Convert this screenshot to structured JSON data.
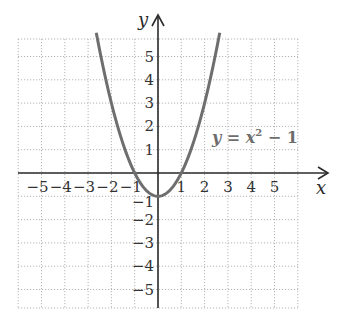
{
  "chart_data": {
    "type": "line",
    "title": "",
    "xlabel": "x",
    "ylabel": "y",
    "xlim": [
      -6,
      6
    ],
    "ylim": [
      -6,
      6.3
    ],
    "grid": true,
    "x_ticks": [
      -5,
      -4,
      -3,
      -2,
      -1,
      1,
      2,
      3,
      4,
      5
    ],
    "y_ticks": [
      -5,
      -4,
      -3,
      -2,
      -1,
      1,
      2,
      3,
      4,
      5
    ],
    "x_tick_labels": [
      "−5",
      "−4",
      "−3",
      "−2",
      "−1",
      "1",
      "2",
      "3",
      "4",
      "5"
    ],
    "y_tick_labels": [
      "−5",
      "−4",
      "−3",
      "−2",
      "−1",
      "1",
      "2",
      "3",
      "4",
      "5"
    ],
    "series": [
      {
        "name": "y = x² − 1",
        "function": "x^2 - 1",
        "x": [
          -2.65,
          -2.5,
          -2,
          -1.5,
          -1,
          -0.5,
          0,
          0.5,
          1,
          1.5,
          2,
          2.5,
          2.65
        ],
        "values": [
          6.02,
          5.25,
          3,
          1.25,
          0,
          -0.75,
          -1,
          -0.75,
          0,
          1.25,
          3,
          5.25,
          6.02
        ],
        "color": "#6e6e6e"
      }
    ],
    "annotations": [
      {
        "text_y": "y",
        "text_eq": " = ",
        "text_x": "x",
        "text_sup": "2",
        "text_rest": " − 1",
        "at": [
          2.4,
          1.3
        ]
      }
    ]
  }
}
